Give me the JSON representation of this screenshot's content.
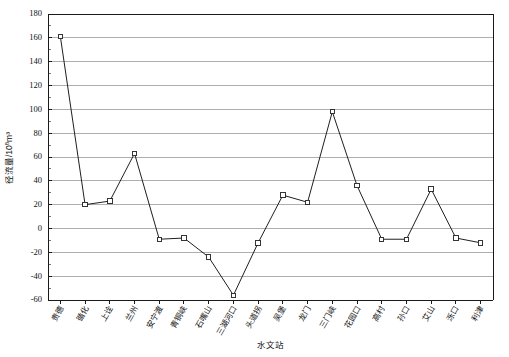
{
  "chart_data": {
    "type": "line",
    "title": "",
    "xlabel": "水文站",
    "ylabel": "径流量/10⁸m³",
    "ylabel_base": "径流量/10",
    "ylabel_sup": "8",
    "ylabel_tail": "m³",
    "ylim": [
      -60,
      180
    ],
    "ytick_step": 20,
    "yticks": [
      180,
      160,
      140,
      120,
      100,
      80,
      60,
      40,
      20,
      0,
      -20,
      -40,
      -60
    ],
    "ytick_labels": [
      "180",
      "160",
      "140",
      "120",
      "100",
      "80",
      "60",
      "40",
      "20",
      "0",
      "-20",
      "-40",
      "-60"
    ],
    "minor_ticks_per_interval": 2,
    "grid": true,
    "grid_axis": "y",
    "legend": "none",
    "marker": "open-square",
    "categories": [
      "贵德",
      "循化",
      "上诠",
      "兰州",
      "安宁渡",
      "青铜峡",
      "石嘴山",
      "三湖河口",
      "头道拐",
      "吴堡",
      "龙门",
      "三门峡",
      "花园口",
      "高村",
      "孙口",
      "艾山",
      "泺口",
      "利津"
    ],
    "values": [
      161,
      20,
      23,
      63,
      -9,
      -8,
      -24,
      -56,
      -12,
      28,
      22,
      98,
      36,
      -9,
      -9,
      33,
      -8,
      -12
    ],
    "series_name": "径流量"
  },
  "figure": {
    "background": "#ffffff",
    "line_color": "#1f1f1f",
    "grid_color": "#9a9a9a",
    "axis_color": "#1a1a1a"
  }
}
